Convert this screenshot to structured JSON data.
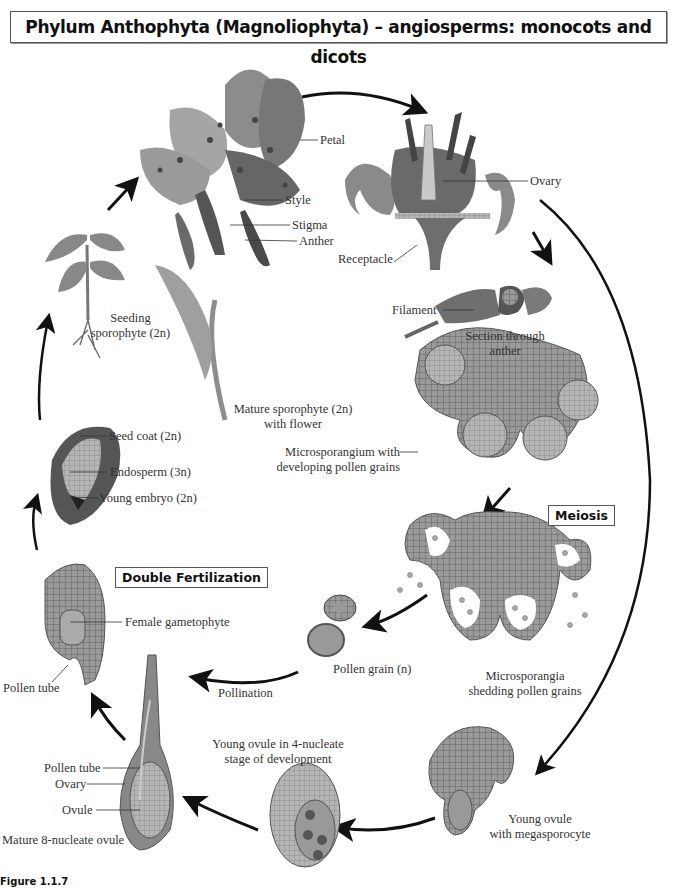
{
  "title": "Phylum Anthophyta (Magnoliophyta) – angiosperms: monocots and dicots",
  "boxes": {
    "meiosis": "Meiosis",
    "double_fertilization": "Double Fertilization"
  },
  "labels": {
    "petal": "Petal",
    "style": "Style",
    "stigma": "Stigma",
    "anther": "Anther",
    "ovary_top": "Ovary",
    "receptacle": "Receptacle",
    "filament": "Filament",
    "section_anther_1": "Section through",
    "section_anther_2": "anther",
    "mature_sporophyte_1": "Mature sporophyte (2n)",
    "mature_sporophyte_2": "with flower",
    "seedling_1": "Seeding",
    "seedling_2": "sporophyte (2n)",
    "seed_coat": "Seed coat (2n)",
    "endosperm": "Endosperm (3n)",
    "young_embryo": "Young embryo (2n)",
    "microsporangium_1": "Microsporangium with",
    "microsporangium_2": "developing pollen grains",
    "female_gametophyte": "Female gametophyte",
    "pollen_tube_left": "Pollen tube",
    "pollination": "Pollination",
    "pollen_grain": "Pollen grain (n)",
    "microsporangia_1": "Microsporangia",
    "microsporangia_2": "shedding pollen grains",
    "young_ovule_4_1": "Young ovule in 4-nucleate",
    "young_ovule_4_2": "stage of development",
    "pollen_tube_ovule": "Pollen tube",
    "ovary_bottom": "Ovary",
    "ovule": "Ovule",
    "mature_8_nucleate": "Mature 8-nucleate ovule",
    "young_ovule_mega_1": "Young ovule",
    "young_ovule_mega_2": "with megasporocyte"
  },
  "caption": "Figure 1.1.7"
}
